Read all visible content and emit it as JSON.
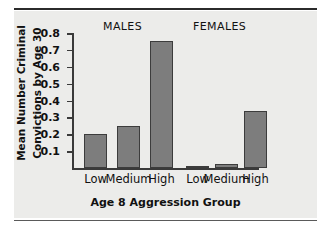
{
  "chart_data": {
    "type": "bar",
    "title": "",
    "xlabel": "Age 8 Aggression Group",
    "ylabel": "Mean Number Criminal Convictions by Age 30",
    "ylabel_lines": [
      "Mean Number Criminal",
      "Convictions by Age 30"
    ],
    "ylim": [
      0,
      0.8
    ],
    "ytick_labels": [
      "0.8",
      "0.7",
      "0.6",
      "0.5",
      "0.4",
      "0.3",
      "0.2",
      "0.1"
    ],
    "ytick_values": [
      0.8,
      0.7,
      0.6,
      0.5,
      0.4,
      0.3,
      0.2,
      0.1
    ],
    "grid": false,
    "legend": "none",
    "group_headers": [
      "MALES",
      "FEMALES"
    ],
    "categories": [
      "Low",
      "Medium",
      "High",
      "Low",
      "Medium",
      "High"
    ],
    "series": [
      {
        "name": "Mean Number Criminal Convictions by Age 30",
        "values": [
          0.2,
          0.25,
          0.75,
          0.01,
          0.025,
          0.34
        ]
      }
    ],
    "groups": [
      {
        "name": "MALES",
        "categories": [
          "Low",
          "Medium",
          "High"
        ],
        "values": [
          0.2,
          0.25,
          0.75
        ]
      },
      {
        "name": "FEMALES",
        "categories": [
          "Low",
          "Medium",
          "High"
        ],
        "values": [
          0.01,
          0.025,
          0.34
        ]
      }
    ],
    "bar_color": "#7d7d7d",
    "bar_edge_color": "#3c3c3c",
    "background_color": "#ececea",
    "axis_color": "#3a3a3a"
  }
}
